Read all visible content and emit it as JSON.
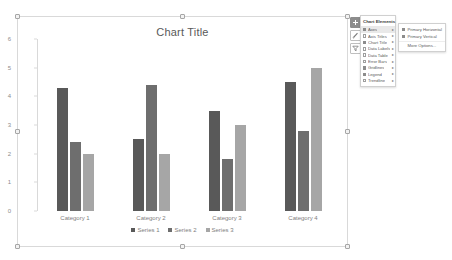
{
  "chart_object": {
    "title": "Chart Title"
  },
  "chart_data": {
    "type": "bar",
    "title": "Chart Title",
    "xlabel": "",
    "ylabel": "",
    "ylim": [
      0,
      6
    ],
    "yticks": [
      0,
      1,
      2,
      3,
      4,
      5,
      6
    ],
    "grid": false,
    "legend_position": "bottom",
    "categories": [
      "Category 1",
      "Category 2",
      "Category 3",
      "Category 4"
    ],
    "series": [
      {
        "name": "Series 1",
        "color": "#595959",
        "values": [
          4.3,
          2.5,
          3.5,
          4.5
        ]
      },
      {
        "name": "Series 2",
        "color": "#6e6e6e",
        "values": [
          2.4,
          4.4,
          1.8,
          2.8
        ]
      },
      {
        "name": "Series 3",
        "color": "#a6a6a6",
        "values": [
          2.0,
          2.0,
          3.0,
          5.0
        ]
      }
    ]
  },
  "chart_buttons": [
    {
      "name": "chart-elements",
      "icon": "plus-icon",
      "active": true
    },
    {
      "name": "chart-styles",
      "icon": "brush-icon",
      "active": false
    },
    {
      "name": "chart-filters",
      "icon": "funnel-icon",
      "active": false
    }
  ],
  "chart_elements_menu": {
    "heading": "Chart Elements",
    "items": [
      {
        "label": "Axes",
        "checked": true,
        "has_submenu": true,
        "highlighted": true
      },
      {
        "label": "Axis Titles",
        "checked": false,
        "has_submenu": true
      },
      {
        "label": "Chart Title",
        "checked": true,
        "has_submenu": true
      },
      {
        "label": "Data Labels",
        "checked": false,
        "has_submenu": true
      },
      {
        "label": "Data Table",
        "checked": false,
        "has_submenu": true
      },
      {
        "label": "Error Bars",
        "checked": false,
        "has_submenu": true
      },
      {
        "label": "Gridlines",
        "checked": true,
        "has_submenu": true
      },
      {
        "label": "Legend",
        "checked": true,
        "has_submenu": true
      },
      {
        "label": "Trendline",
        "checked": false,
        "has_submenu": true
      }
    ]
  },
  "axes_submenu": {
    "items": [
      {
        "label": "Primary Horizontal",
        "checked": true
      },
      {
        "label": "Primary Vertical",
        "checked": true
      }
    ],
    "more_options": "More Options..."
  }
}
